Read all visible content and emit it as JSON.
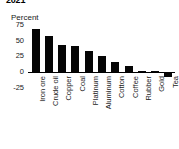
{
  "chart_data": {
    "type": "bar",
    "title": "2021",
    "subtitle": "",
    "xlabel": "",
    "ylabel": "Percent",
    "ylim": [
      -25,
      75
    ],
    "yticks": [
      75,
      50,
      25,
      0,
      -25
    ],
    "ytick_labels": [
      "75",
      "50",
      "25",
      "0",
      "-25"
    ],
    "grid": false,
    "legend": false,
    "bar_color": "#050505",
    "categories": [
      "Iron ore",
      "Crude oil",
      "Copper",
      "Coal",
      "Platinum",
      "Aluminum",
      "Cotton",
      "Coffee",
      "Rubber",
      "Gold",
      "Tea"
    ],
    "values": [
      68,
      58,
      43,
      42,
      33,
      25,
      16,
      10,
      1,
      0,
      -8
    ]
  }
}
